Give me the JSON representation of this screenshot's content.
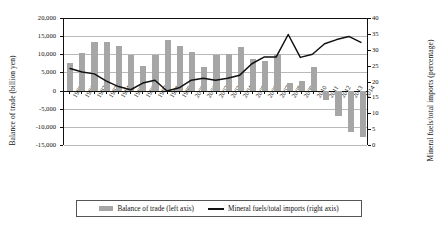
{
  "chart_data": {
    "type": "bar",
    "title": "",
    "subtitle": "",
    "xlabel": "",
    "ylabel": "Balance of trade (billion yen)",
    "y2label": "Mineral fuels/total imports (percentage)",
    "grid": true,
    "legend_position": "bottom",
    "ylim": [
      -15000,
      20000
    ],
    "y2lim": [
      0,
      40
    ],
    "yticks": [
      "20,000",
      "15,000",
      "10,000",
      "5,000",
      "0",
      "-5,000",
      "-10,000",
      "-15,000"
    ],
    "ytick_values": [
      20000,
      15000,
      10000,
      5000,
      0,
      -5000,
      -10000,
      -15000
    ],
    "y2ticks": [
      "40",
      "35",
      "30",
      "25",
      "20",
      "15",
      "10",
      "5",
      "0"
    ],
    "y2tick_values": [
      40,
      35,
      30,
      25,
      20,
      15,
      10,
      5,
      0
    ],
    "categories": [
      "1990",
      "1991",
      "1992",
      "1993",
      "1994",
      "1995",
      "1996",
      "1997",
      "1998",
      "1999",
      "2000",
      "2001",
      "2002",
      "2003",
      "2004",
      "2005",
      "2006",
      "2007",
      "2008",
      "2009",
      "2010",
      "2011",
      "2012",
      "2013",
      "2014"
    ],
    "series": [
      {
        "name": "Balance of trade (left axis)",
        "type": "bar",
        "axis": "left",
        "color": "#a6a6a6",
        "values": [
          7500,
          10300,
          13300,
          13300,
          12300,
          9900,
          6700,
          9900,
          13900,
          12300,
          10600,
          6500,
          9900,
          10000,
          12000,
          8800,
          8100,
          10200,
          2100,
          2700,
          6600,
          -2500,
          -6900,
          -11500,
          -12800
        ]
      },
      {
        "name": "Mineral fuels/total imports (right axis)",
        "type": "line",
        "axis": "right",
        "color": "#111111",
        "values": [
          24.1,
          23.0,
          22.4,
          20.1,
          18.4,
          17.4,
          19.5,
          20.4,
          17.0,
          18.0,
          20.4,
          21.0,
          20.4,
          21.0,
          22.0,
          25.6,
          27.7,
          27.7,
          34.8,
          27.6,
          28.6,
          31.9,
          33.2,
          34.2,
          32.3
        ]
      }
    ]
  },
  "legend": {
    "items": [
      {
        "label": "Balance of trade (left axis)",
        "marker": "bar-swatch-icon"
      },
      {
        "label": "Mineral fuels/total imports (right axis)",
        "marker": "line-swatch-icon"
      }
    ]
  }
}
